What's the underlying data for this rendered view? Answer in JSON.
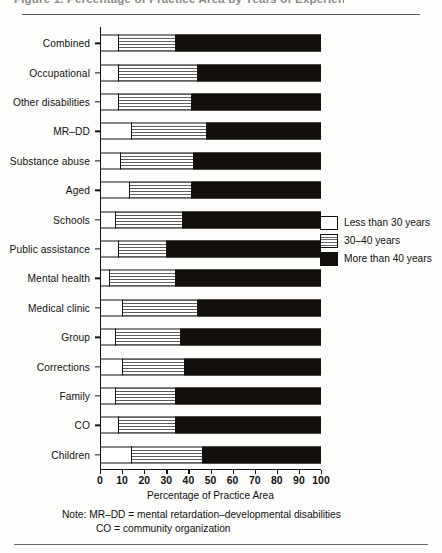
{
  "figure": {
    "title": "Figure 1. Percentage of Practice Area by Years of Experience",
    "xaxis_title": "Percentage of Practice Area",
    "note_line1": "Note: MR–DD = mental retardation–developmental disabilities",
    "note_line2": "CO = community organization"
  },
  "legend": {
    "position": "right-middle",
    "items": [
      {
        "label": "Less than 30 years",
        "swatch": "white-box-icon",
        "color": "#ffffff"
      },
      {
        "label": "30–40 years",
        "swatch": "striped-box-icon",
        "color": "#8a8a8a"
      },
      {
        "label": "More than 40 years",
        "swatch": "black-box-icon",
        "color": "#120f0d"
      }
    ]
  },
  "chart_data": {
    "type": "bar",
    "subtype": "stacked-horizontal-100-percent",
    "title": "Percentage of Practice Area by Years of Experience",
    "xlabel": "Percentage of Practice Area",
    "ylabel": "",
    "xlim": [
      0,
      100
    ],
    "xticks": [
      0,
      10,
      20,
      30,
      40,
      50,
      60,
      70,
      80,
      90,
      100
    ],
    "xtick_labels": [
      "0",
      "10",
      "20",
      "30",
      "40",
      "50",
      "60",
      "70",
      "80",
      "90",
      "100"
    ],
    "grid": false,
    "legend_position": "right",
    "categories": [
      "Combined",
      "Occupational",
      "Other disabilities",
      "MR–DD",
      "Substance abuse",
      "Aged",
      "Schools",
      "Public assistance",
      "Mental health",
      "Medical clinic",
      "Group",
      "Corrections",
      "Family",
      "CO",
      "Children"
    ],
    "series": [
      {
        "name": "Less than 30 years",
        "color": "#ffffff",
        "values": [
          8,
          8,
          8,
          14,
          9,
          13,
          7,
          8,
          4,
          10,
          7,
          10,
          7,
          8,
          14
        ]
      },
      {
        "name": "30–40 years",
        "color": "#8a8a8a",
        "values": [
          26,
          36,
          33,
          34,
          33,
          28,
          30,
          22,
          30,
          34,
          29,
          28,
          27,
          26,
          32
        ]
      },
      {
        "name": "More than 40 years",
        "color": "#120f0d",
        "values": [
          66,
          56,
          59,
          52,
          58,
          59,
          63,
          70,
          66,
          56,
          64,
          62,
          66,
          66,
          54
        ]
      }
    ]
  }
}
